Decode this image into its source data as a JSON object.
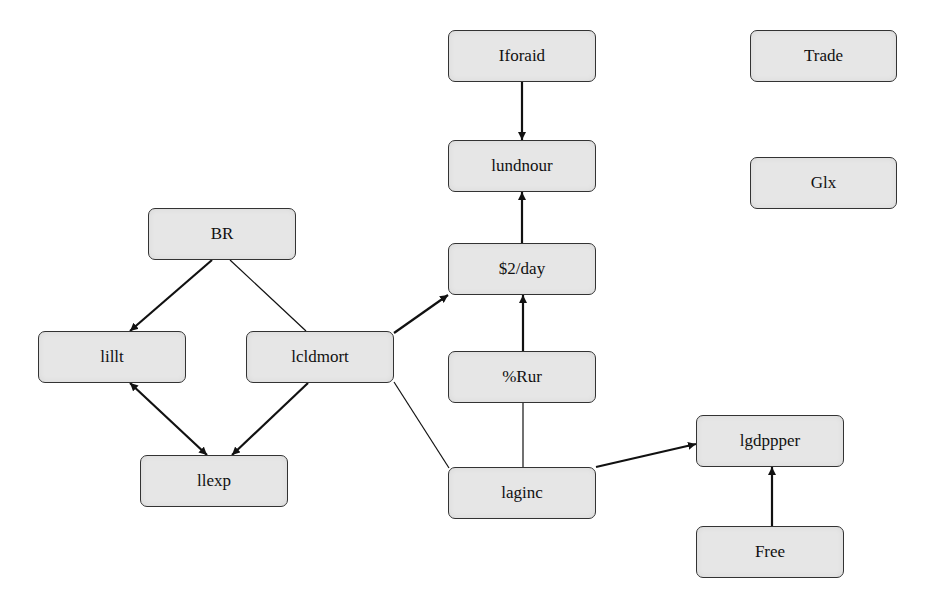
{
  "diagram": {
    "type": "directed-graph",
    "colors": {
      "node_fill": "#e6e6e6",
      "node_border": "#333333",
      "edge": "#111111",
      "background": "#ffffff"
    },
    "nodes": [
      {
        "id": "iforaid",
        "label": "Iforaid",
        "x": 448,
        "y": 30,
        "w": 148,
        "h": 52
      },
      {
        "id": "lundnour",
        "label": "lundnour",
        "x": 448,
        "y": 140,
        "w": 148,
        "h": 52
      },
      {
        "id": "trade",
        "label": "Trade",
        "x": 750,
        "y": 30,
        "w": 147,
        "h": 52
      },
      {
        "id": "glx",
        "label": "Glx",
        "x": 750,
        "y": 157,
        "w": 147,
        "h": 52
      },
      {
        "id": "br",
        "label": "BR",
        "x": 148,
        "y": 208,
        "w": 148,
        "h": 52
      },
      {
        "id": "twoday",
        "label": "$2/day",
        "x": 448,
        "y": 243,
        "w": 148,
        "h": 52
      },
      {
        "id": "lillt",
        "label": "lillt",
        "x": 38,
        "y": 331,
        "w": 148,
        "h": 52
      },
      {
        "id": "lcldmort",
        "label": "lcldmort",
        "x": 246,
        "y": 331,
        "w": 148,
        "h": 52
      },
      {
        "id": "rur",
        "label": "%Rur",
        "x": 448,
        "y": 351,
        "w": 148,
        "h": 52
      },
      {
        "id": "lgdppper",
        "label": "lgdppper",
        "x": 696,
        "y": 415,
        "w": 148,
        "h": 52
      },
      {
        "id": "llexp",
        "label": "llexp",
        "x": 140,
        "y": 455,
        "w": 148,
        "h": 52
      },
      {
        "id": "laginc",
        "label": "laginc",
        "x": 448,
        "y": 467,
        "w": 148,
        "h": 52
      },
      {
        "id": "free",
        "label": "Free",
        "x": 696,
        "y": 526,
        "w": 148,
        "h": 52
      }
    ],
    "edges": [
      {
        "from": "iforaid",
        "to": "lundnour",
        "directed": true,
        "bidirectional": false,
        "x1": 522,
        "y1": 82,
        "x2": 522,
        "y2": 140
      },
      {
        "from": "twoday",
        "to": "lundnour",
        "directed": true,
        "bidirectional": false,
        "x1": 522,
        "y1": 243,
        "x2": 522,
        "y2": 192
      },
      {
        "from": "br",
        "to": "lillt",
        "directed": true,
        "bidirectional": false,
        "x1": 212,
        "y1": 260,
        "x2": 130,
        "y2": 331
      },
      {
        "from": "br",
        "to": "lcldmort",
        "directed": false,
        "bidirectional": false,
        "x1": 230,
        "y1": 260,
        "x2": 306,
        "y2": 331
      },
      {
        "from": "lcldmort",
        "to": "twoday",
        "directed": true,
        "bidirectional": false,
        "x1": 394,
        "y1": 333,
        "x2": 448,
        "y2": 295
      },
      {
        "from": "lillt",
        "to": "llexp",
        "directed": true,
        "bidirectional": true,
        "x1": 130,
        "y1": 383,
        "x2": 207,
        "y2": 455
      },
      {
        "from": "lcldmort",
        "to": "llexp",
        "directed": true,
        "bidirectional": false,
        "x1": 308,
        "y1": 383,
        "x2": 232,
        "y2": 455
      },
      {
        "from": "rur",
        "to": "twoday",
        "directed": true,
        "bidirectional": false,
        "x1": 523,
        "y1": 351,
        "x2": 523,
        "y2": 295
      },
      {
        "from": "rur",
        "to": "laginc",
        "directed": false,
        "bidirectional": false,
        "x1": 523,
        "y1": 403,
        "x2": 523,
        "y2": 467
      },
      {
        "from": "lcldmort",
        "to": "laginc",
        "directed": false,
        "bidirectional": false,
        "x1": 394,
        "y1": 382,
        "x2": 449,
        "y2": 468
      },
      {
        "from": "laginc",
        "to": "lgdppper",
        "directed": true,
        "bidirectional": false,
        "x1": 596,
        "y1": 467,
        "x2": 696,
        "y2": 444
      },
      {
        "from": "free",
        "to": "lgdppper",
        "directed": true,
        "bidirectional": false,
        "x1": 772,
        "y1": 526,
        "x2": 772,
        "y2": 467
      }
    ]
  }
}
